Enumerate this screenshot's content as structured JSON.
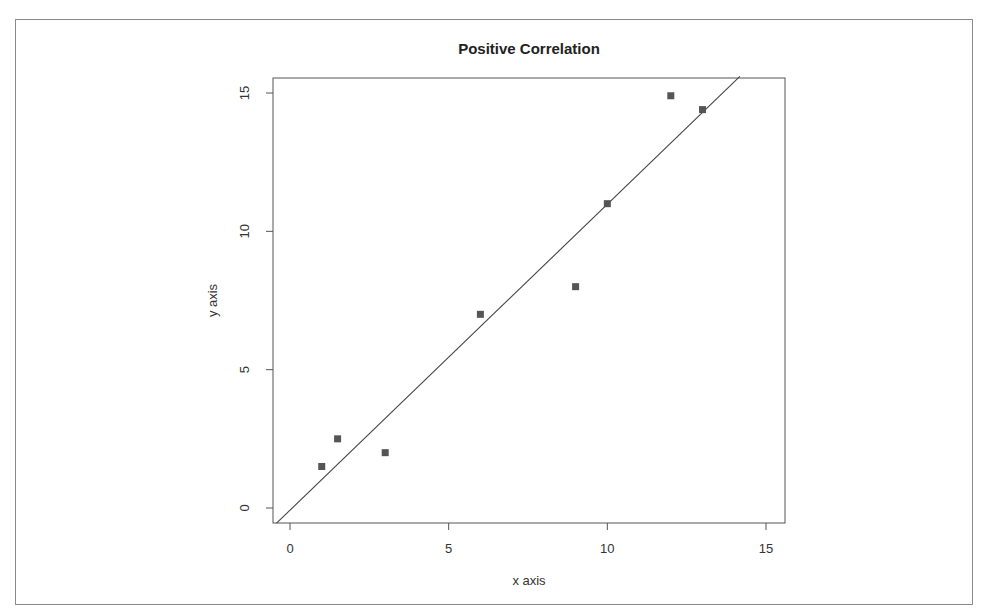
{
  "chart_data": {
    "type": "scatter",
    "title": "Positive Correlation",
    "xlabel": "x axis",
    "ylabel": "y axis",
    "xlim": [
      -0.55,
      15.55
    ],
    "ylim": [
      -0.55,
      15.6
    ],
    "x_ticks": [
      0,
      5,
      10,
      15
    ],
    "y_ticks": [
      0,
      5,
      10,
      15
    ],
    "x_tick_labels": [
      "0",
      "5",
      "10",
      "15"
    ],
    "y_tick_labels": [
      "0",
      "5",
      "10",
      "15"
    ],
    "grid": false,
    "legend": null,
    "marker": "filled-square",
    "points": [
      {
        "x": 1.0,
        "y": 1.5
      },
      {
        "x": 1.5,
        "y": 2.5
      },
      {
        "x": 3.0,
        "y": 2.0
      },
      {
        "x": 6.0,
        "y": 7.0
      },
      {
        "x": 9.0,
        "y": 8.0
      },
      {
        "x": 10.0,
        "y": 11.0
      },
      {
        "x": 12.0,
        "y": 14.9
      },
      {
        "x": 13.0,
        "y": 14.4
      }
    ],
    "fit_line": {
      "slope": 1.106,
      "intercept": -0.08
    },
    "colors": {
      "marker": "#555555",
      "line": "#444444",
      "frame": "#555555"
    }
  }
}
